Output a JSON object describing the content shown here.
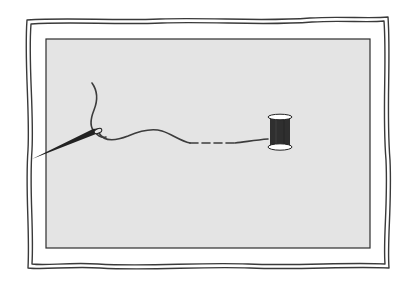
{
  "illustration": {
    "subject": "needle threaded with a long thread leading to a spool",
    "colors": {
      "background": "#ffffff",
      "frame_stroke": "#3a3a3a",
      "panel_fill": "#e4e4e4",
      "panel_stroke": "#2e2e2e",
      "thread": "#3c3c3c",
      "needle": "#222222",
      "spool_thread": "#2f2f2f",
      "spool_flange": "#ffffff"
    },
    "elements": [
      "wavy-double-frame",
      "gray-panel",
      "needle",
      "thread",
      "spool"
    ]
  }
}
